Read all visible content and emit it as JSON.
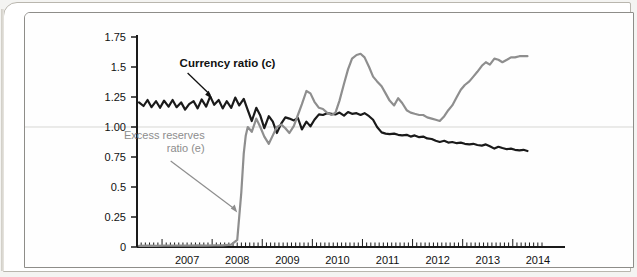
{
  "figure": {
    "frame_border_color": "#8e8d89",
    "outer_border_color": "#b9b6ae",
    "background_color": "#fefefe"
  },
  "chart_data": {
    "type": "line",
    "title": "",
    "subtitle": "",
    "xlabel": "",
    "ylabel": "",
    "xlim": [
      2006.5,
      2014.6
    ],
    "ylim": [
      0,
      1.75
    ],
    "grid": "single horizontal gridline at 1.00",
    "legend_position": "inline annotations",
    "y_ticks": [
      0,
      0.25,
      0.5,
      0.75,
      1.0,
      1.25,
      1.5,
      1.75
    ],
    "y_tick_labels": [
      "0",
      "0.25",
      "0.5",
      "0.75",
      "1.00",
      "1.25",
      "1.5",
      "1.75"
    ],
    "x_ticks": [
      2007,
      2008,
      2009,
      2010,
      2011,
      2012,
      2013,
      2014
    ],
    "x_tick_labels": [
      "2007",
      "2008",
      "2009",
      "2010",
      "2011",
      "2012",
      "2013",
      "2014"
    ],
    "x_minor_tick_interval": 0.0833,
    "annotations": [
      {
        "name": "currency-ratio-label",
        "text": "Currency ratio (c)",
        "color": "#111111",
        "bold": true,
        "x": 2007.35,
        "y": 1.5,
        "arrow_to_x": 2008.0,
        "arrow_to_y": 1.235
      },
      {
        "name": "excess-reserves-label",
        "text_line1": "Excess reserves",
        "text_line2": "ratio (e)",
        "color": "#8d8d8d",
        "bold": false,
        "x": 2007.85,
        "y": 0.9,
        "arrow_to_x": 2008.52,
        "arrow_to_y": 0.28
      }
    ],
    "series": [
      {
        "name": "Currency ratio (c)",
        "color": "#1a1a1a",
        "line_width": 2.2,
        "x": [
          2006.54,
          2006.63,
          2006.71,
          2006.79,
          2006.88,
          2006.96,
          2007.04,
          2007.13,
          2007.21,
          2007.29,
          2007.38,
          2007.46,
          2007.54,
          2007.63,
          2007.71,
          2007.79,
          2007.88,
          2007.96,
          2008.04,
          2008.13,
          2008.21,
          2008.29,
          2008.38,
          2008.46,
          2008.54,
          2008.63,
          2008.71,
          2008.79,
          2008.88,
          2008.96,
          2009.04,
          2009.13,
          2009.21,
          2009.29,
          2009.38,
          2009.46,
          2009.54,
          2009.63,
          2009.71,
          2009.79,
          2009.88,
          2009.96,
          2010.04,
          2010.13,
          2010.21,
          2010.29,
          2010.38,
          2010.46,
          2010.54,
          2010.63,
          2010.71,
          2010.79,
          2010.88,
          2010.96,
          2011.04,
          2011.13,
          2011.21,
          2011.29,
          2011.38,
          2011.46,
          2011.54,
          2011.63,
          2011.71,
          2011.79,
          2011.88,
          2011.96,
          2012.04,
          2012.13,
          2012.21,
          2012.29,
          2012.38,
          2012.46,
          2012.54,
          2012.63,
          2012.71,
          2012.79,
          2012.88,
          2012.96,
          2013.04,
          2013.13,
          2013.21,
          2013.29,
          2013.38,
          2013.46,
          2013.54,
          2013.63,
          2013.71,
          2013.79,
          2013.88,
          2013.96,
          2014.04,
          2014.13,
          2014.21,
          2014.29
        ],
        "values": [
          1.205,
          1.175,
          1.225,
          1.165,
          1.215,
          1.16,
          1.22,
          1.17,
          1.225,
          1.165,
          1.205,
          1.145,
          1.19,
          1.215,
          1.155,
          1.23,
          1.17,
          1.255,
          1.185,
          1.225,
          1.155,
          1.215,
          1.16,
          1.245,
          1.18,
          1.235,
          1.14,
          1.05,
          1.16,
          1.095,
          0.99,
          1.09,
          1.045,
          0.95,
          1.03,
          1.08,
          1.07,
          1.055,
          1.075,
          0.98,
          1.045,
          1.005,
          1.06,
          1.105,
          1.1,
          1.115,
          1.11,
          1.105,
          1.12,
          1.095,
          1.125,
          1.11,
          1.115,
          1.1,
          1.115,
          1.09,
          1.06,
          1.0,
          0.955,
          0.945,
          0.94,
          0.945,
          0.935,
          0.93,
          0.935,
          0.92,
          0.93,
          0.915,
          0.92,
          0.905,
          0.9,
          0.885,
          0.875,
          0.885,
          0.87,
          0.875,
          0.865,
          0.87,
          0.86,
          0.855,
          0.86,
          0.85,
          0.845,
          0.855,
          0.84,
          0.82,
          0.835,
          0.825,
          0.815,
          0.82,
          0.81,
          0.805,
          0.81,
          0.8
        ]
      },
      {
        "name": "Excess reserves ratio (e)",
        "color": "#8e8e8e",
        "line_width": 2.2,
        "x": [
          2006.54,
          2006.71,
          2006.88,
          2007.04,
          2007.21,
          2007.38,
          2007.54,
          2007.71,
          2007.88,
          2008.04,
          2008.21,
          2008.38,
          2008.5,
          2008.58,
          2008.63,
          2008.67,
          2008.71,
          2008.79,
          2008.88,
          2008.96,
          2009.04,
          2009.13,
          2009.21,
          2009.29,
          2009.38,
          2009.46,
          2009.54,
          2009.63,
          2009.71,
          2009.79,
          2009.88,
          2009.96,
          2010.04,
          2010.13,
          2010.21,
          2010.29,
          2010.38,
          2010.46,
          2010.54,
          2010.63,
          2010.71,
          2010.79,
          2010.88,
          2010.96,
          2011.04,
          2011.13,
          2011.21,
          2011.29,
          2011.38,
          2011.46,
          2011.54,
          2011.63,
          2011.71,
          2011.79,
          2011.88,
          2011.96,
          2012.04,
          2012.13,
          2012.21,
          2012.29,
          2012.38,
          2012.46,
          2012.54,
          2012.63,
          2012.71,
          2012.79,
          2012.88,
          2012.96,
          2013.04,
          2013.13,
          2013.21,
          2013.29,
          2013.38,
          2013.46,
          2013.54,
          2013.63,
          2013.71,
          2013.79,
          2013.88,
          2013.96,
          2014.04,
          2014.13,
          2014.21,
          2014.29
        ],
        "values": [
          0.01,
          0.012,
          0.01,
          0.012,
          0.011,
          0.012,
          0.011,
          0.013,
          0.012,
          0.014,
          0.013,
          0.02,
          0.06,
          0.45,
          0.78,
          0.93,
          1.0,
          0.96,
          1.07,
          1.0,
          0.92,
          0.86,
          0.93,
          1.0,
          1.02,
          0.99,
          0.95,
          1.01,
          1.1,
          1.19,
          1.3,
          1.28,
          1.21,
          1.16,
          1.15,
          1.12,
          1.1,
          1.12,
          1.22,
          1.36,
          1.48,
          1.57,
          1.6,
          1.61,
          1.58,
          1.5,
          1.42,
          1.38,
          1.34,
          1.28,
          1.22,
          1.18,
          1.24,
          1.2,
          1.14,
          1.12,
          1.11,
          1.1,
          1.1,
          1.08,
          1.07,
          1.06,
          1.05,
          1.09,
          1.14,
          1.18,
          1.25,
          1.31,
          1.35,
          1.38,
          1.42,
          1.46,
          1.51,
          1.54,
          1.52,
          1.57,
          1.56,
          1.54,
          1.56,
          1.58,
          1.58,
          1.59,
          1.59,
          1.59
        ]
      }
    ]
  }
}
